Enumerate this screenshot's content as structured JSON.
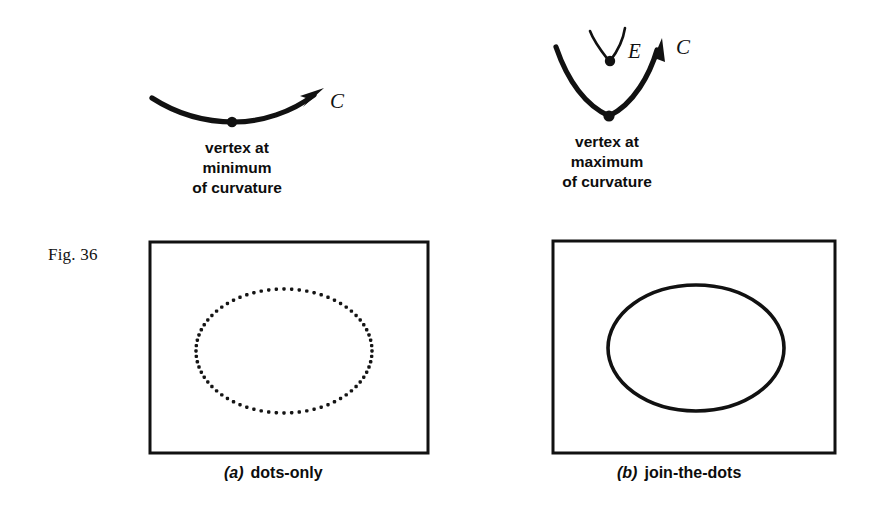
{
  "figure": {
    "label": "Fig. 36",
    "accent_color": "#111111",
    "background_color": "#ffffff"
  },
  "diagrams": {
    "left": {
      "caption_lines": [
        "vertex at",
        "minimum",
        "of curvature"
      ],
      "curve_label": "C",
      "curve_kind": "shallow-concave-arc-with-arrow",
      "vertex_dot": {
        "x": 232,
        "y": 122
      },
      "arrow_tip": {
        "x": 323,
        "y": 90
      }
    },
    "right": {
      "caption_lines": [
        "vertex at",
        "maximum",
        "of curvature"
      ],
      "curve_label": "C",
      "evolute_label": "E",
      "curve_kind": "deep-u-arc-with-arrow-and-cusp",
      "vertex_dot": {
        "x": 609,
        "y": 116
      },
      "cusp_dot": {
        "x": 610,
        "y": 60
      },
      "arrow_tip": {
        "x": 662,
        "y": 42
      }
    }
  },
  "panels": [
    {
      "tag": "(a)",
      "tag_letter": "a",
      "title": "dots-only",
      "box": {
        "x": 150,
        "y": 242,
        "width": 278,
        "height": 211
      },
      "shape": "dotted-ellipse",
      "ellipse": {
        "cx": 284,
        "cy": 351,
        "rx": 88,
        "ry": 62
      },
      "dot_count": 72,
      "dot_size": 3.4
    },
    {
      "tag": "(b)",
      "tag_letter": "b",
      "title": "join-the-dots",
      "box": {
        "x": 553,
        "y": 241,
        "width": 282,
        "height": 212
      },
      "shape": "solid-ellipse",
      "ellipse": {
        "cx": 696,
        "cy": 348,
        "rx": 88,
        "ry": 63
      },
      "stroke_width": 3.6
    }
  ]
}
